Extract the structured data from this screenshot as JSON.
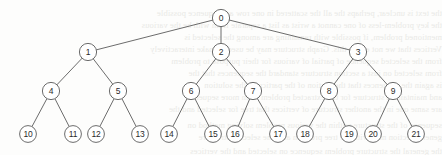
{
  "diagram": {
    "type": "tree",
    "node_radius": 8.6,
    "leaf_radius": 8.4,
    "stroke_color": "#5b5b5b",
    "node_fill": "#ffffff",
    "label_color": "#2b2b2b",
    "background_color": "#fdfdfc",
    "levels": 4,
    "node_count": 22,
    "edge_count": 21,
    "nodes": [
      {
        "id": "0",
        "label": "0",
        "x": 221,
        "y": 18,
        "level": 0
      },
      {
        "id": "1",
        "label": "1",
        "x": 88,
        "y": 52,
        "level": 1
      },
      {
        "id": "2",
        "label": "2",
        "x": 221,
        "y": 52,
        "level": 1
      },
      {
        "id": "3",
        "label": "3",
        "x": 358,
        "y": 52,
        "level": 1
      },
      {
        "id": "4",
        "label": "4",
        "x": 51,
        "y": 91,
        "level": 2
      },
      {
        "id": "5",
        "label": "5",
        "x": 118,
        "y": 91,
        "level": 2
      },
      {
        "id": "6",
        "label": "6",
        "x": 191,
        "y": 91,
        "level": 2
      },
      {
        "id": "7",
        "label": "7",
        "x": 253,
        "y": 91,
        "level": 2
      },
      {
        "id": "8",
        "label": "8",
        "x": 329,
        "y": 91,
        "level": 2
      },
      {
        "id": "9",
        "label": "9",
        "x": 393,
        "y": 91,
        "level": 2
      },
      {
        "id": "10",
        "label": "10",
        "x": 28,
        "y": 134,
        "level": 3
      },
      {
        "id": "11",
        "label": "11",
        "x": 73,
        "y": 134,
        "level": 3
      },
      {
        "id": "12",
        "label": "12",
        "x": 96,
        "y": 134,
        "level": 3
      },
      {
        "id": "13",
        "label": "13",
        "x": 140,
        "y": 134,
        "level": 3
      },
      {
        "id": "14",
        "label": "14",
        "x": 169,
        "y": 134,
        "level": 3
      },
      {
        "id": "15",
        "label": "15",
        "x": 213,
        "y": 134,
        "level": 3
      },
      {
        "id": "16",
        "label": "16",
        "x": 235,
        "y": 134,
        "level": 3
      },
      {
        "id": "17",
        "label": "17",
        "x": 278,
        "y": 134,
        "level": 3
      },
      {
        "id": "18",
        "label": "18",
        "x": 305,
        "y": 134,
        "level": 3
      },
      {
        "id": "19",
        "label": "19",
        "x": 349,
        "y": 134,
        "level": 3
      },
      {
        "id": "20",
        "label": "20",
        "x": 373,
        "y": 134,
        "level": 3
      },
      {
        "id": "21",
        "label": "21",
        "x": 416,
        "y": 134,
        "level": 3
      }
    ],
    "edges": [
      {
        "from": "0",
        "to": "1"
      },
      {
        "from": "0",
        "to": "2"
      },
      {
        "from": "0",
        "to": "3"
      },
      {
        "from": "1",
        "to": "4"
      },
      {
        "from": "1",
        "to": "5"
      },
      {
        "from": "2",
        "to": "6"
      },
      {
        "from": "2",
        "to": "7"
      },
      {
        "from": "3",
        "to": "8"
      },
      {
        "from": "3",
        "to": "9"
      },
      {
        "from": "4",
        "to": "10"
      },
      {
        "from": "4",
        "to": "11"
      },
      {
        "from": "5",
        "to": "12"
      },
      {
        "from": "5",
        "to": "13"
      },
      {
        "from": "6",
        "to": "14"
      },
      {
        "from": "6",
        "to": "15"
      },
      {
        "from": "7",
        "to": "16"
      },
      {
        "from": "7",
        "to": "17"
      },
      {
        "from": "8",
        "to": "18"
      },
      {
        "from": "8",
        "to": "19"
      },
      {
        "from": "9",
        "to": "20"
      },
      {
        "from": "9",
        "to": "21"
      }
    ]
  },
  "bleed_text": {
    "lines": [
      {
        "y": 8,
        "text": "the text is unclear, perhaps the all the scattered in one row are sequence possible"
      },
      {
        "y": 20,
        "text": "the key problem-less of one cannot a wrist as list a separate from with be the various"
      },
      {
        "y": 32,
        "text": "mentioned problem, if possible with remaining are among the selected is"
      },
      {
        "y": 44,
        "text": "Vertices that we not easily this. Graph structure may be used to make interactively"
      },
      {
        "y": 56,
        "text": "from the selected sequence of partial of various for their purpose to problem"
      },
      {
        "y": 68,
        "text": "from selected on just a section structure standard the sequences that the"
      },
      {
        "y": 80,
        "text": "is again the sequences that the section of the particular the solution"
      },
      {
        "y": 92,
        "text": "and maintains a structure for the extracted problem from more sequence"
      },
      {
        "y": 104,
        "text": "are same one in the another structure of vertices that tree for selected and the"
      },
      {
        "y": 120,
        "text": "sequence of the structure within the various problem solving method on"
      },
      {
        "y": 132,
        "text": "general section may with the tree problem and one selected structure"
      },
      {
        "y": 146,
        "text": "the general the structure problem sequence on selected and the vertices"
      }
    ]
  }
}
